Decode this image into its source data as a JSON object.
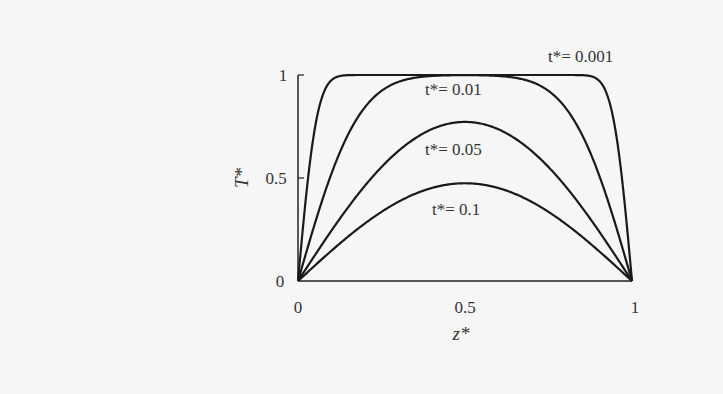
{
  "chart_data": {
    "type": "line",
    "title": "",
    "xlabel": "z*",
    "ylabel": "T*",
    "xlim": [
      0,
      1
    ],
    "ylim": [
      0,
      1
    ],
    "grid": false,
    "x_ticks": [
      "0",
      "0.5",
      "1"
    ],
    "y_ticks": [
      "0",
      "0.5",
      "1"
    ],
    "x": [
      0,
      0.05,
      0.1,
      0.2,
      0.3,
      0.4,
      0.5,
      0.6,
      0.7,
      0.8,
      0.9,
      0.95,
      1
    ],
    "series": [
      {
        "name": "t*= 0.001",
        "t": 0.001,
        "values": [
          0,
          0.69,
          0.94,
          1.0,
          1.0,
          1.0,
          1.0,
          1.0,
          1.0,
          1.0,
          0.94,
          0.69,
          0
        ]
      },
      {
        "name": "t*= 0.01",
        "t": 0.01,
        "values": [
          0,
          0.28,
          0.52,
          0.84,
          0.97,
          1.0,
          1.0,
          1.0,
          0.97,
          0.84,
          0.52,
          0.28,
          0
        ]
      },
      {
        "name": "t*= 0.05",
        "t": 0.05,
        "values": [
          0,
          0.12,
          0.24,
          0.46,
          0.63,
          0.74,
          0.78,
          0.74,
          0.63,
          0.46,
          0.24,
          0.12,
          0
        ]
      },
      {
        "name": "t*= 0.1",
        "t": 0.1,
        "values": [
          0,
          0.07,
          0.15,
          0.28,
          0.38,
          0.45,
          0.47,
          0.45,
          0.38,
          0.28,
          0.15,
          0.07,
          0
        ]
      }
    ],
    "annotations": [
      {
        "text": "t*= 0.001",
        "x": 0.75,
        "y": 1.1
      },
      {
        "text": "t*= 0.01",
        "x": 0.38,
        "y": 0.93
      },
      {
        "text": "t*= 0.05",
        "x": 0.38,
        "y": 0.64
      },
      {
        "text": "t*= 0.1",
        "x": 0.4,
        "y": 0.35
      }
    ]
  }
}
